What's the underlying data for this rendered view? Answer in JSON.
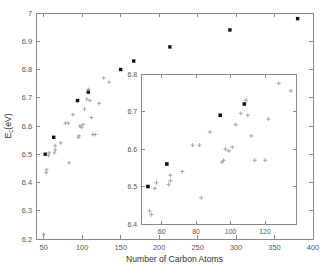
{
  "figure": {
    "background_color": "#ffffff",
    "axis_color": "#8a8a8a",
    "marker_cross_color": "#9a9a9a",
    "marker_square_color": "#111111"
  },
  "chart_data": {
    "type": "scatter",
    "title": "",
    "xlabel": "Number of Carbon Atoms",
    "ylabel": "E_c(eV)",
    "ylabel_base": "E",
    "ylabel_sub": "c",
    "ylabel_unit": "(eV)",
    "xlim": [
      40,
      400
    ],
    "ylim": [
      6.2,
      7.0
    ],
    "xticks": [
      50,
      100,
      150,
      200,
      250,
      300,
      350,
      400
    ],
    "xticklabels": [
      "50",
      "100",
      "150",
      "200",
      "250",
      "300",
      "350",
      "400"
    ],
    "yticks": [
      6.2,
      6.3,
      6.4,
      6.5,
      6.6,
      6.7,
      6.8,
      6.9,
      7.0
    ],
    "yticklabels": [
      "6.2",
      "6.3",
      "6.4",
      "6.5",
      "6.6",
      "6.7",
      "6.8",
      "6.9",
      "7"
    ],
    "grid": false,
    "legend": "none",
    "series": [
      {
        "name": "filled-squares",
        "marker": "square",
        "color": "#111111",
        "points": [
          [
            52,
            6.5
          ],
          [
            63,
            6.56
          ],
          [
            94,
            6.69
          ],
          [
            108,
            6.72
          ],
          [
            150,
            6.8
          ],
          [
            167,
            6.83
          ],
          [
            214,
            6.88
          ],
          [
            292,
            6.94
          ],
          [
            380,
            6.98
          ]
        ]
      },
      {
        "name": "crosses",
        "marker": "plus",
        "color": "#9a9a9a",
        "points": [
          [
            50,
            6.215
          ],
          [
            53,
            6.435
          ],
          [
            54,
            6.445
          ],
          [
            56,
            6.495
          ],
          [
            57,
            6.505
          ],
          [
            64,
            6.505
          ],
          [
            65,
            6.515
          ],
          [
            65,
            6.53
          ],
          [
            72,
            6.54
          ],
          [
            78,
            6.61
          ],
          [
            82,
            6.61
          ],
          [
            83,
            6.47
          ],
          [
            88,
            6.64
          ],
          [
            95,
            6.56
          ],
          [
            96,
            6.565
          ],
          [
            97,
            6.6
          ],
          [
            99,
            6.595
          ],
          [
            101,
            6.605
          ],
          [
            103,
            6.66
          ],
          [
            106,
            6.695
          ],
          [
            108,
            6.73
          ],
          [
            110,
            6.69
          ],
          [
            112,
            6.63
          ],
          [
            114,
            6.57
          ],
          [
            117,
            6.57
          ],
          [
            122,
            6.68
          ],
          [
            128,
            6.77
          ],
          [
            135,
            6.755
          ]
        ]
      }
    ]
  },
  "inset": {
    "type": "scatter",
    "xlabel": "",
    "ylabel": "",
    "xlim": [
      48,
      138
    ],
    "ylim": [
      6.4,
      6.8
    ],
    "xticks": [
      60,
      80,
      100,
      120
    ],
    "xticklabels": [
      "60",
      "80",
      "100",
      "120"
    ],
    "yticks": [
      6.4,
      6.5,
      6.6,
      6.7,
      6.8
    ],
    "yticklabels": [
      "6.4",
      "6.5",
      "6.6",
      "6.7",
      "6.8"
    ],
    "grid": false,
    "series": [
      {
        "name": "filled-squares",
        "marker": "square",
        "color": "#111111",
        "points": [
          [
            52,
            6.5
          ],
          [
            63,
            6.56
          ],
          [
            94,
            6.69
          ],
          [
            108,
            6.72
          ]
        ]
      },
      {
        "name": "crosses",
        "marker": "plus",
        "color": "#9a9a9a",
        "points": [
          [
            53,
            6.435
          ],
          [
            54,
            6.425
          ],
          [
            56,
            6.495
          ],
          [
            57,
            6.51
          ],
          [
            64,
            6.505
          ],
          [
            65,
            6.515
          ],
          [
            65,
            6.53
          ],
          [
            72,
            6.54
          ],
          [
            78,
            6.61
          ],
          [
            82,
            6.61
          ],
          [
            83,
            6.47
          ],
          [
            88,
            6.645
          ],
          [
            95,
            6.565
          ],
          [
            96,
            6.57
          ],
          [
            97,
            6.6
          ],
          [
            99,
            6.595
          ],
          [
            101,
            6.605
          ],
          [
            103,
            6.665
          ],
          [
            106,
            6.695
          ],
          [
            109,
            6.73
          ],
          [
            110,
            6.69
          ],
          [
            112,
            6.635
          ],
          [
            114,
            6.57
          ],
          [
            120,
            6.57
          ],
          [
            122,
            6.68
          ],
          [
            128,
            6.775
          ],
          [
            135,
            6.755
          ]
        ]
      }
    ]
  }
}
